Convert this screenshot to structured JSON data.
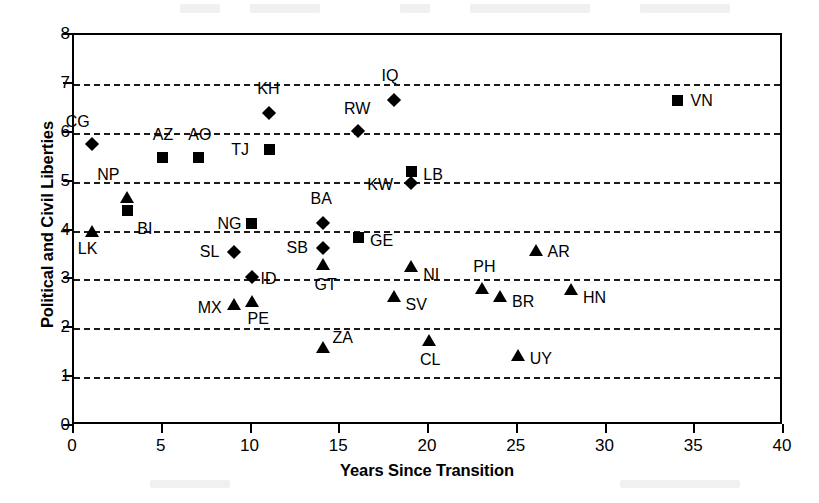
{
  "chart_data": {
    "type": "scatter",
    "title": "",
    "xlabel": "Years Since Transition",
    "ylabel": "Political and Civil Liberties",
    "xlim": [
      0,
      40
    ],
    "ylim": [
      0,
      8
    ],
    "xticks": [
      0,
      5,
      10,
      15,
      20,
      25,
      30,
      35,
      40
    ],
    "yticks": [
      0,
      1,
      2,
      3,
      4,
      5,
      6,
      7,
      8
    ],
    "grid": "horizontal-dashed",
    "legend": "none",
    "marker_shapes": [
      "square",
      "diamond",
      "triangle"
    ],
    "points": [
      {
        "label": "CG",
        "x": 1,
        "y": 5.77,
        "marker": "diamond",
        "lx": -26,
        "ly": -30
      },
      {
        "label": "LK",
        "x": 1,
        "y": 4.0,
        "marker": "triangle",
        "lx": -14,
        "ly": 10
      },
      {
        "label": "NP",
        "x": 3,
        "y": 4.68,
        "marker": "triangle",
        "lx": -30,
        "ly": -30
      },
      {
        "label": "BI",
        "x": 3,
        "y": 4.4,
        "marker": "square",
        "lx": 10,
        "ly": 10
      },
      {
        "label": "AZ",
        "x": 5,
        "y": 5.5,
        "marker": "square",
        "lx": -10,
        "ly": -30
      },
      {
        "label": "AO",
        "x": 7,
        "y": 5.5,
        "marker": "square",
        "lx": -10,
        "ly": -30
      },
      {
        "label": "SL",
        "x": 9,
        "y": 3.57,
        "marker": "diamond",
        "lx": -34,
        "ly": -8
      },
      {
        "label": "MX",
        "x": 9,
        "y": 2.5,
        "marker": "triangle",
        "lx": -36,
        "ly": -4
      },
      {
        "label": "NG",
        "x": 10,
        "y": 4.14,
        "marker": "square",
        "lx": -34,
        "ly": -8
      },
      {
        "label": "ID",
        "x": 10,
        "y": 3.05,
        "marker": "diamond",
        "lx": 9,
        "ly": -6
      },
      {
        "label": "PE",
        "x": 10,
        "y": 2.55,
        "marker": "triangle",
        "lx": -4,
        "ly": 10
      },
      {
        "label": "KH",
        "x": 11,
        "y": 6.41,
        "marker": "diamond",
        "lx": -12,
        "ly": -32
      },
      {
        "label": "TJ",
        "x": 11,
        "y": 5.65,
        "marker": "square",
        "lx": -38,
        "ly": -8
      },
      {
        "label": "BA",
        "x": 14,
        "y": 4.15,
        "marker": "diamond",
        "lx": -12,
        "ly": -32
      },
      {
        "label": "SB",
        "x": 14,
        "y": 3.65,
        "marker": "diamond",
        "lx": -36,
        "ly": -8
      },
      {
        "label": "GT",
        "x": 14,
        "y": 3.32,
        "marker": "triangle",
        "lx": -8,
        "ly": 13
      },
      {
        "label": "ZA",
        "x": 14,
        "y": 1.62,
        "marker": "triangle",
        "lx": 10,
        "ly": -17
      },
      {
        "label": "RW",
        "x": 16,
        "y": 6.03,
        "marker": "diamond",
        "lx": -14,
        "ly": -30
      },
      {
        "label": "GE",
        "x": 16,
        "y": 3.85,
        "marker": "square",
        "lx": 12,
        "ly": -5
      },
      {
        "label": "IQ",
        "x": 18,
        "y": 6.66,
        "marker": "diamond",
        "lx": -12,
        "ly": -32
      },
      {
        "label": "SV",
        "x": 18,
        "y": 2.67,
        "marker": "triangle",
        "lx": 12,
        "ly": 1
      },
      {
        "label": "KW",
        "x": 19,
        "y": 4.98,
        "marker": "diamond",
        "lx": -44,
        "ly": -6
      },
      {
        "label": "NI",
        "x": 19,
        "y": 3.27,
        "marker": "triangle",
        "lx": 12,
        "ly": 1
      },
      {
        "label": "LB",
        "x": 19,
        "y": 5.2,
        "marker": "square",
        "lx": 12,
        "ly": -5
      },
      {
        "label": "CL",
        "x": 20,
        "y": 1.75,
        "marker": "triangle",
        "lx": -9,
        "ly": 12
      },
      {
        "label": "PH",
        "x": 23,
        "y": 2.83,
        "marker": "triangle",
        "lx": -9,
        "ly": -29
      },
      {
        "label": "BR",
        "x": 24,
        "y": 2.65,
        "marker": "triangle",
        "lx": 12,
        "ly": -2
      },
      {
        "label": "UY",
        "x": 25,
        "y": 1.45,
        "marker": "triangle",
        "lx": 12,
        "ly": -4
      },
      {
        "label": "AR",
        "x": 26,
        "y": 3.6,
        "marker": "triangle",
        "lx": 12,
        "ly": -6
      },
      {
        "label": "HN",
        "x": 28,
        "y": 2.8,
        "marker": "triangle",
        "lx": 12,
        "ly": 1
      },
      {
        "label": "VN",
        "x": 34,
        "y": 6.67,
        "marker": "square",
        "lx": 13,
        "ly": -7
      }
    ]
  },
  "axes": {
    "y_title": "Political and Civil Liberties",
    "x_title": "Years Since Transition"
  }
}
